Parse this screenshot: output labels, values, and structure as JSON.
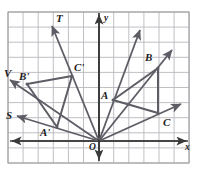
{
  "figure": {
    "kind": "coordinate-plane-geometry-diagram",
    "width": 199,
    "height": 170,
    "background_color": "#ffffff",
    "grid": {
      "visible": true,
      "color": "#b9b9bd",
      "cell_size_px": 15.1,
      "left_px": 8,
      "top_px": 12,
      "right_px": 189,
      "bottom_px": 163,
      "columns": 12,
      "rows": 10,
      "border_color": "#9a9a9e"
    },
    "axes": {
      "color": "#3a3a3a",
      "origin_px": {
        "x": 99,
        "y": 141
      },
      "x_axis_label": "x",
      "y_axis_label": "y",
      "origin_label": "O",
      "x_axis_y_px": 141,
      "y_axis_x_px": 99,
      "arrowheads": [
        "left",
        "right",
        "up",
        "down"
      ]
    },
    "stroke_color": "#5d5d66",
    "labels": [
      {
        "text": "T",
        "x": 56,
        "y": 13,
        "name": "label-T"
      },
      {
        "text": "y",
        "x": 104,
        "y": 14,
        "name": "label-y-axis"
      },
      {
        "text": "B",
        "x": 145,
        "y": 52,
        "name": "label-B"
      },
      {
        "text": "C'",
        "x": 74,
        "y": 62,
        "name": "label-C-prime"
      },
      {
        "text": "V",
        "x": 4,
        "y": 68,
        "name": "label-V"
      },
      {
        "text": "B'",
        "x": 19,
        "y": 71,
        "name": "label-B-prime"
      },
      {
        "text": "A",
        "x": 101,
        "y": 90,
        "name": "label-A"
      },
      {
        "text": "S",
        "x": 6,
        "y": 110,
        "name": "label-S"
      },
      {
        "text": "C",
        "x": 163,
        "y": 117,
        "name": "label-C"
      },
      {
        "text": "A'",
        "x": 40,
        "y": 127,
        "name": "label-A-prime"
      },
      {
        "text": "O",
        "x": 89,
        "y": 143,
        "name": "label-O"
      },
      {
        "text": "x",
        "x": 185,
        "y": 143,
        "name": "label-x-axis"
      }
    ],
    "points": {
      "O": {
        "px": {
          "x": 99,
          "y": 141
        },
        "grid": {
          "x": 0,
          "y": 0
        }
      },
      "A": {
        "px": {
          "x": 113,
          "y": 100
        },
        "grid": {
          "x": 1,
          "y": 2.7
        }
      },
      "B": {
        "px": {
          "x": 158,
          "y": 68
        },
        "grid": {
          "x": 4,
          "y": 4.8
        }
      },
      "C": {
        "px": {
          "x": 158,
          "y": 113
        },
        "grid": {
          "x": 4,
          "y": 1.9
        }
      },
      "A_prime": {
        "px": {
          "x": 57,
          "y": 127
        },
        "grid": {
          "x": -2.8,
          "y": 0.9
        }
      },
      "B_prime": {
        "px": {
          "x": 27,
          "y": 84
        },
        "grid": {
          "x": -4.8,
          "y": 3.8
        }
      },
      "C_prime": {
        "px": {
          "x": 72,
          "y": 76
        },
        "grid": {
          "x": -1.8,
          "y": 4.3
        }
      }
    },
    "triangles": [
      {
        "name": "triangle-ABC",
        "vertices": [
          "A",
          "B",
          "C"
        ]
      },
      {
        "name": "triangle-A-prime-B-prime-C-prime",
        "vertices": [
          "A_prime",
          "B_prime",
          "C_prime"
        ]
      }
    ],
    "rays_from_origin": [
      {
        "name": "ray-O-A-extended",
        "through": "A",
        "tip_px": {
          "x": 140,
          "y": 30
        }
      },
      {
        "name": "ray-O-B-extended",
        "through": "B",
        "tip_px": {
          "x": 172,
          "y": 50
        }
      },
      {
        "name": "ray-O-C-extended",
        "through": "C",
        "tip_px": {
          "x": 181,
          "y": 104
        }
      },
      {
        "name": "ray-O-C-prime-to-T",
        "through": "C_prime",
        "tip_px": {
          "x": 52,
          "y": 26
        },
        "endpoint_label": "T"
      },
      {
        "name": "ray-O-B-prime-to-V",
        "through": "B_prime",
        "tip_px": {
          "x": 10,
          "y": 80
        },
        "endpoint_label": "V"
      },
      {
        "name": "ray-O-A-prime-to-S",
        "through": "A_prime",
        "tip_px": {
          "x": 17,
          "y": 116
        },
        "endpoint_label": "S"
      }
    ],
    "caption": ""
  }
}
